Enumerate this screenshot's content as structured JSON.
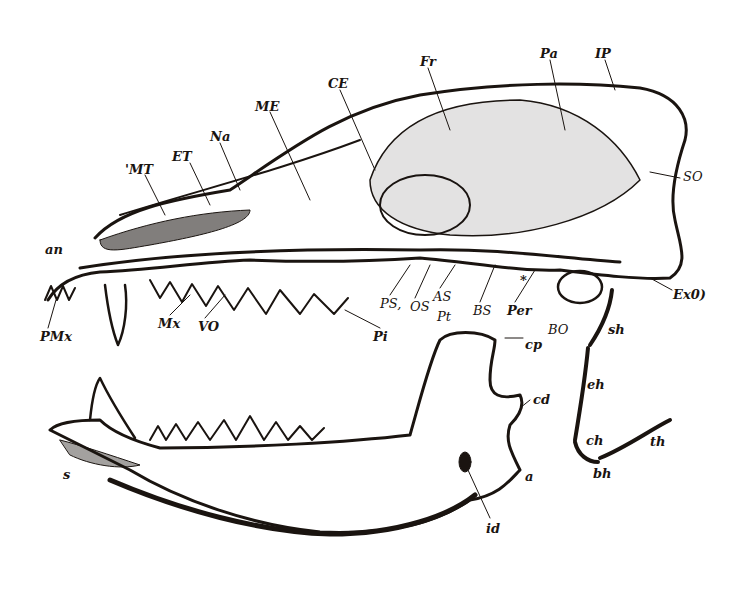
{
  "figure": {
    "ink_color": "#1a1410",
    "paper_color": "#ffffff"
  },
  "labels": {
    "skull": [
      {
        "id": "Pr",
        "text": "Fr",
        "x": 420,
        "y": 55
      },
      {
        "id": "Pa",
        "text": "Pa",
        "x": 540,
        "y": 47
      },
      {
        "id": "IP",
        "text": "IP",
        "x": 595,
        "y": 47
      },
      {
        "id": "CE",
        "text": "CE",
        "x": 328,
        "y": 77
      },
      {
        "id": "ME",
        "text": "ME",
        "x": 255,
        "y": 100
      },
      {
        "id": "Na",
        "text": "Na",
        "x": 210,
        "y": 130
      },
      {
        "id": "ET",
        "text": "ET",
        "x": 172,
        "y": 150
      },
      {
        "id": "MT",
        "text": "'MT",
        "x": 125,
        "y": 163
      },
      {
        "id": "SO",
        "text": "SO",
        "x": 683,
        "y": 170
      },
      {
        "id": "an",
        "text": "an",
        "x": 45,
        "y": 243
      },
      {
        "id": "ExO",
        "text": "Ex0)",
        "x": 673,
        "y": 288
      },
      {
        "id": "star",
        "text": "*",
        "x": 520,
        "y": 274
      },
      {
        "id": "PS",
        "text": "PS,",
        "x": 380,
        "y": 297
      },
      {
        "id": "OS",
        "text": "OS",
        "x": 410,
        "y": 300
      },
      {
        "id": "AS",
        "text": "AS",
        "x": 433,
        "y": 290
      },
      {
        "id": "Pt2",
        "text": "Pt",
        "x": 437,
        "y": 310
      },
      {
        "id": "BS",
        "text": "BS",
        "x": 473,
        "y": 304
      },
      {
        "id": "Per",
        "text": "Per",
        "x": 507,
        "y": 304
      },
      {
        "id": "BO",
        "text": "BO",
        "x": 548,
        "y": 323
      },
      {
        "id": "sh",
        "text": "sh",
        "x": 608,
        "y": 323
      },
      {
        "id": "Mx",
        "text": "Mx",
        "x": 158,
        "y": 317
      },
      {
        "id": "VO",
        "text": "VO",
        "x": 198,
        "y": 320
      },
      {
        "id": "PMx",
        "text": "PMx",
        "x": 40,
        "y": 330
      },
      {
        "id": "Pt",
        "text": "Pi",
        "x": 373,
        "y": 330
      }
    ],
    "mandible": [
      {
        "id": "cp",
        "text": "cp",
        "x": 525,
        "y": 338
      },
      {
        "id": "cd",
        "text": "cd",
        "x": 533,
        "y": 393
      },
      {
        "id": "a",
        "text": "a",
        "x": 525,
        "y": 470
      },
      {
        "id": "id",
        "text": "id",
        "x": 486,
        "y": 522
      },
      {
        "id": "s",
        "text": "s",
        "x": 63,
        "y": 468
      }
    ],
    "hyoid": [
      {
        "id": "eh",
        "text": "eh",
        "x": 587,
        "y": 378
      },
      {
        "id": "ch",
        "text": "ch",
        "x": 586,
        "y": 434
      },
      {
        "id": "th",
        "text": "th",
        "x": 650,
        "y": 435
      },
      {
        "id": "bh",
        "text": "bh",
        "x": 593,
        "y": 467
      }
    ]
  }
}
